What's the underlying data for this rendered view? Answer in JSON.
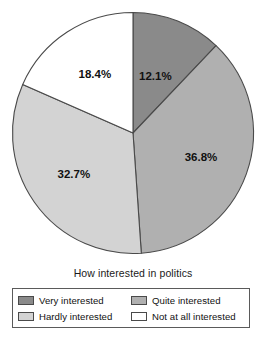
{
  "chart_data": {
    "type": "pie",
    "title": "",
    "xlabel": "How interested in politics",
    "ylabel": "",
    "categories": [
      "Very interested",
      "Quite interested",
      "Hardly interested",
      "Not at all interested"
    ],
    "values": [
      12.1,
      36.8,
      32.7,
      18.4
    ],
    "value_labels": [
      "12.1%",
      "36.8%",
      "32.7%",
      "18.4%"
    ],
    "colors": [
      "#8a8a8a",
      "#b0b0b0",
      "#d3d3d3",
      "#ffffff"
    ],
    "start_angle_deg": 0,
    "direction": "clockwise",
    "grid": false,
    "legend_position": "bottom",
    "legend": [
      {
        "label": "Very interested",
        "color": "#8a8a8a"
      },
      {
        "label": "Quite interested",
        "color": "#b0b0b0"
      },
      {
        "label": "Hardly interested",
        "color": "#d3d3d3"
      },
      {
        "label": "Not at all interested",
        "color": "#ffffff"
      }
    ]
  },
  "caption": {
    "text": "How interested in politics"
  },
  "style": {
    "outline_color": "#4a4a4a",
    "label_color": "#111111"
  }
}
